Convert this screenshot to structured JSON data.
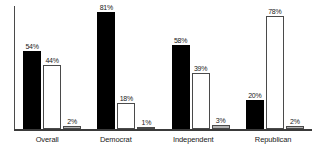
{
  "chart_data": {
    "type": "bar",
    "title": "",
    "subtitle": "",
    "xlabel": "",
    "ylabel": "",
    "ylim": [
      0,
      85
    ],
    "grid": false,
    "legend": false,
    "legend_position": "none",
    "axis": {
      "y_axis_line": true,
      "x_axis_line": true,
      "y_tick_labels": [],
      "x_tick_labels": [
        "Overall",
        "Democrat",
        "Independent",
        "Republican"
      ]
    },
    "categories": [
      "Overall",
      "Democrat",
      "Independent",
      "Republican"
    ],
    "series": [
      {
        "name": "series-1",
        "style": "black-filled",
        "color": "#000000",
        "values": [
          54,
          81,
          58,
          20
        ],
        "labels": [
          "54%",
          "81%",
          "58%",
          "20%"
        ]
      },
      {
        "name": "series-2",
        "style": "white-outlined",
        "color": "#ffffff",
        "values": [
          44,
          18,
          39,
          78
        ],
        "labels": [
          "44%",
          "18%",
          "39%",
          "78%"
        ]
      },
      {
        "name": "series-3",
        "style": "gray-filled",
        "color": "#b5b5b5",
        "values": [
          2,
          1,
          3,
          2
        ],
        "labels": [
          "2%",
          "1%",
          "3%",
          "2%"
        ]
      }
    ]
  }
}
